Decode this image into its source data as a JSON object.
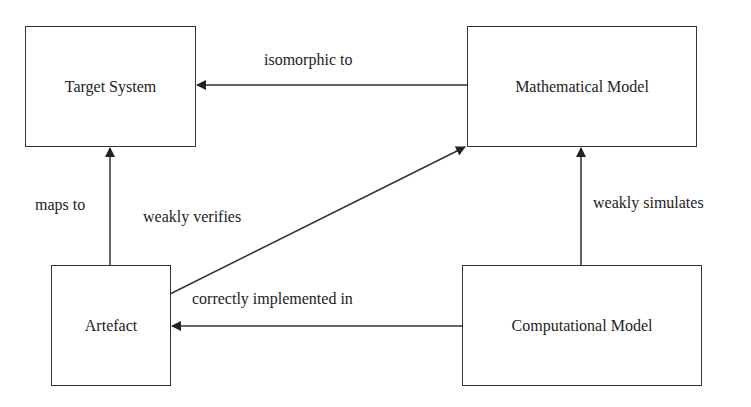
{
  "nodes": {
    "target_system": "Target System",
    "mathematical_model": "Mathematical Model",
    "artefact": "Artefact",
    "computational_model": "Computational Model"
  },
  "edges": {
    "isomorphic_to": "isomorphic to",
    "maps_to": "maps to",
    "weakly_verifies": "weakly verifies",
    "weakly_simulates": "weakly simulates",
    "correctly_implemented_in": "correctly implemented in"
  },
  "relations": [
    {
      "from": "Mathematical Model",
      "to": "Target System",
      "label": "isomorphic to"
    },
    {
      "from": "Artefact",
      "to": "Target System",
      "label": "maps to"
    },
    {
      "from": "Artefact",
      "to": "Mathematical Model",
      "label": "weakly verifies"
    },
    {
      "from": "Computational Model",
      "to": "Mathematical Model",
      "label": "weakly simulates"
    },
    {
      "from": "Computational Model",
      "to": "Artefact",
      "label": "correctly implemented in"
    }
  ]
}
